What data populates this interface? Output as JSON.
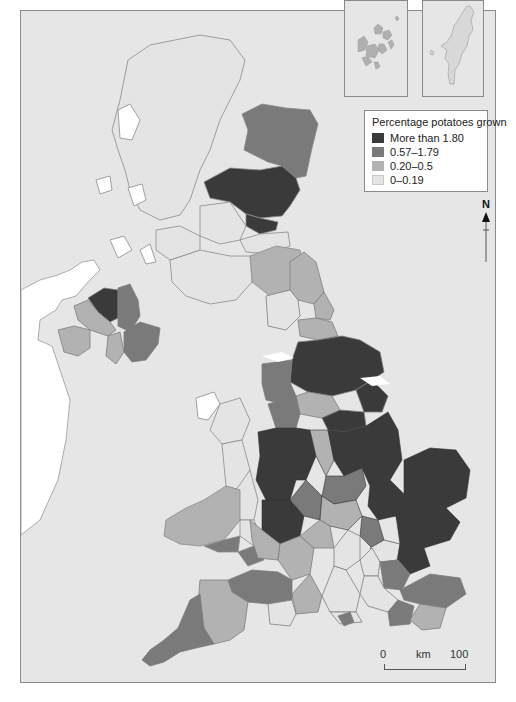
{
  "map": {
    "subject": "Percentage potatoes grown by county, United Kingdom",
    "insets": [
      {
        "name": "Orkney"
      },
      {
        "name": "Shetland"
      }
    ]
  },
  "legend": {
    "title": "Percentage potatoes grown",
    "items": [
      {
        "label": "More than 1.80",
        "color": "#3a3a3a"
      },
      {
        "label": "0.57–1.79",
        "color": "#7a7a7a"
      },
      {
        "label": "0.20–0.5",
        "color": "#b2b2b2"
      },
      {
        "label": "0–0.19",
        "color": "#e4e4e4"
      }
    ]
  },
  "north_arrow": {
    "label": "N"
  },
  "scale_bar": {
    "start": "0",
    "unit": "km",
    "end": "100"
  },
  "colors": {
    "sea": "#e6e6e6",
    "ireland": "#ffffff",
    "border": "#7d7d7d",
    "class_1": "#3a3a3a",
    "class_2": "#7a7a7a",
    "class_3": "#b2b2b2",
    "class_4": "#e4e4e4"
  }
}
